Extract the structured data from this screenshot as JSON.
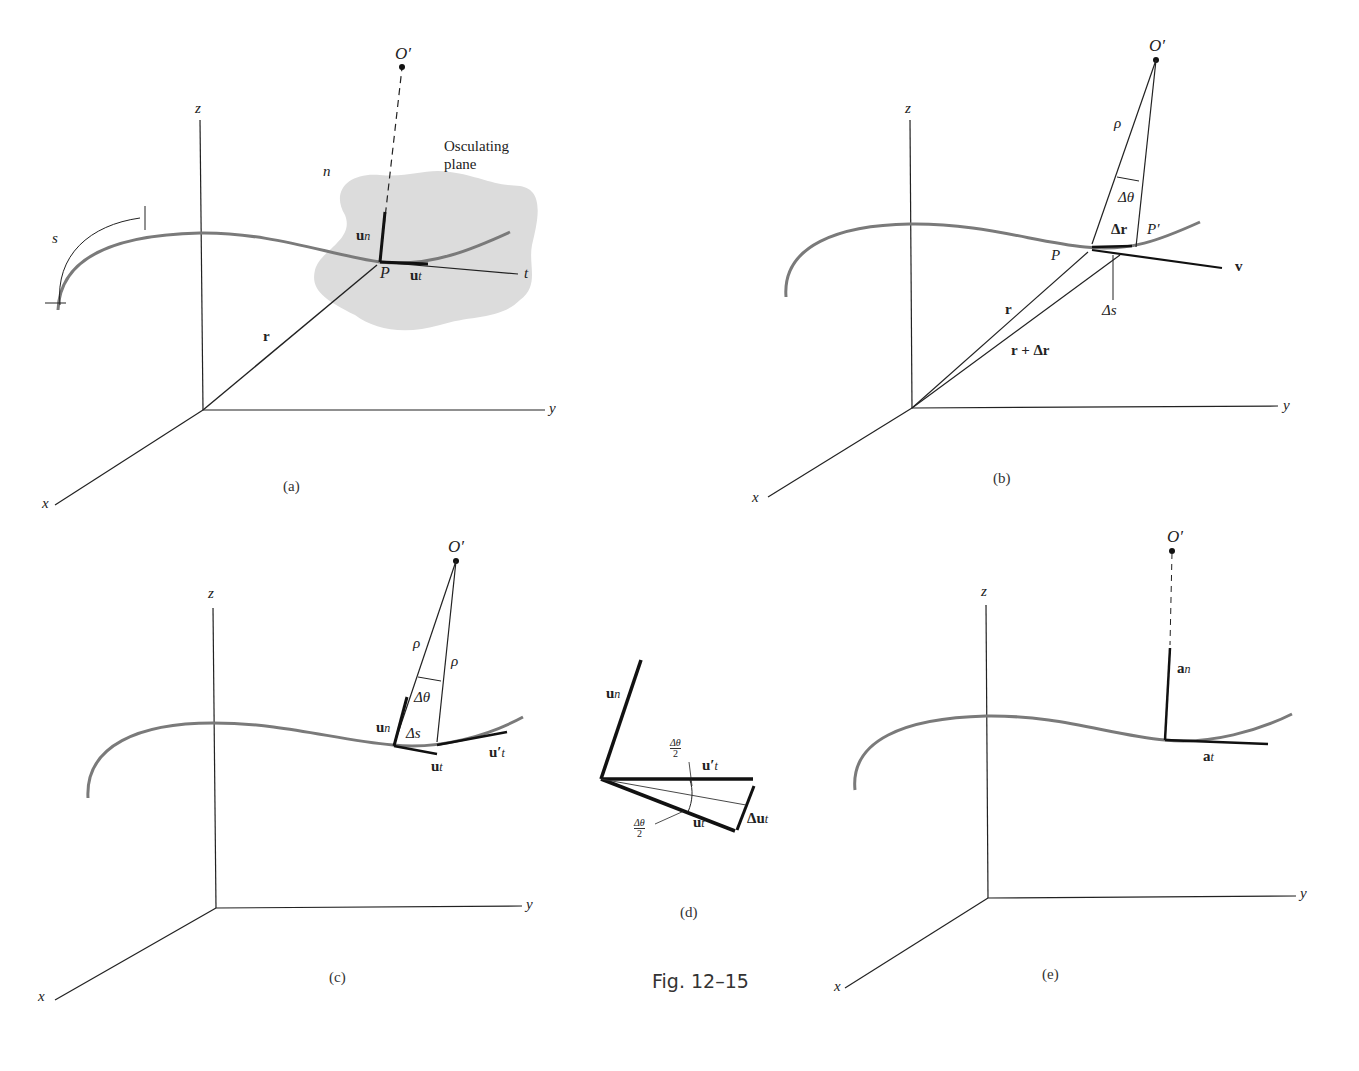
{
  "figure": {
    "caption": "Fig. 12–15",
    "panels": [
      {
        "id": "a",
        "label": "(a)"
      },
      {
        "id": "b",
        "label": "(b)"
      },
      {
        "id": "c",
        "label": "(c)"
      },
      {
        "id": "d",
        "label": "(d)"
      },
      {
        "id": "e",
        "label": "(e)"
      }
    ]
  },
  "panel_a": {
    "axis_x": "x",
    "axis_y": "y",
    "axis_z": "z",
    "center": "O′",
    "normal_axis": "n",
    "tangent_axis": "t",
    "plane_label_line1": "Osculating",
    "plane_label_line2": "plane",
    "point": "P",
    "position_vector": "r",
    "unit_normal": "u",
    "unit_normal_sub": "n",
    "unit_tangent": "u",
    "unit_tangent_sub": "t",
    "arc_length": "s"
  },
  "panel_b": {
    "axis_x": "x",
    "axis_y": "y",
    "axis_z": "z",
    "center": "O′",
    "radius": "ρ",
    "angle": "Δθ",
    "point_p": "P",
    "point_p_prime": "P′",
    "delta_r": "Δr",
    "delta_s": "Δs",
    "velocity": "v",
    "position_vector": "r",
    "position_vector_2": "r + Δr"
  },
  "panel_c": {
    "axis_x": "x",
    "axis_y": "y",
    "axis_z": "z",
    "center": "O′",
    "radius_1": "ρ",
    "radius_2": "ρ",
    "angle": "Δθ",
    "delta_s": "Δs",
    "unit_normal": "u",
    "unit_normal_sub": "n",
    "unit_tangent": "u",
    "unit_tangent_sub": "t",
    "unit_tangent_prime": "u′",
    "unit_tangent_prime_sub": "t"
  },
  "panel_d": {
    "unit_normal": "u",
    "unit_normal_sub": "n",
    "unit_tangent": "u",
    "unit_tangent_sub": "t",
    "unit_tangent_prime": "u′",
    "unit_tangent_prime_sub": "t",
    "delta_ut": "Δu",
    "delta_ut_sub": "t",
    "half_angle_num": "Δθ",
    "half_angle_den": "2"
  },
  "panel_e": {
    "axis_x": "x",
    "axis_y": "y",
    "axis_z": "z",
    "center": "O′",
    "normal_accel": "a",
    "normal_accel_sub": "n",
    "tangent_accel": "a",
    "tangent_accel_sub": "t"
  },
  "colors": {
    "line": "#222222",
    "curve": "#7a7a7a",
    "plane_fill": "#d9d9d9"
  }
}
